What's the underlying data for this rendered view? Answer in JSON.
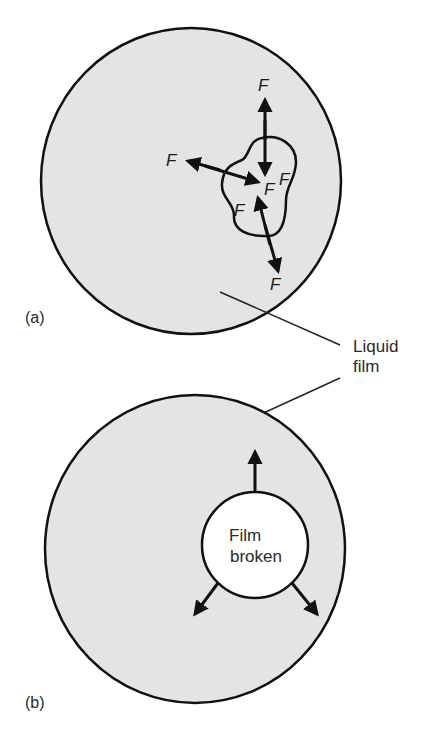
{
  "figure": {
    "panels": [
      {
        "id": "a",
        "label": "(a)",
        "description": "Liquid film with a small thinned region; surface tension forces balanced",
        "force_labels": [
          "F",
          "F",
          "F",
          "F",
          "F",
          "F"
        ]
      },
      {
        "id": "b",
        "label": "(b)",
        "description": "Film broken; hole expands outward",
        "hole_label_line1": "Film",
        "hole_label_line2": "broken"
      }
    ],
    "callout": {
      "line1": "Liquid",
      "line2": "film"
    }
  },
  "colors": {
    "film": "#e4e4e4",
    "outline": "#111111",
    "hole": "#ffffff"
  }
}
